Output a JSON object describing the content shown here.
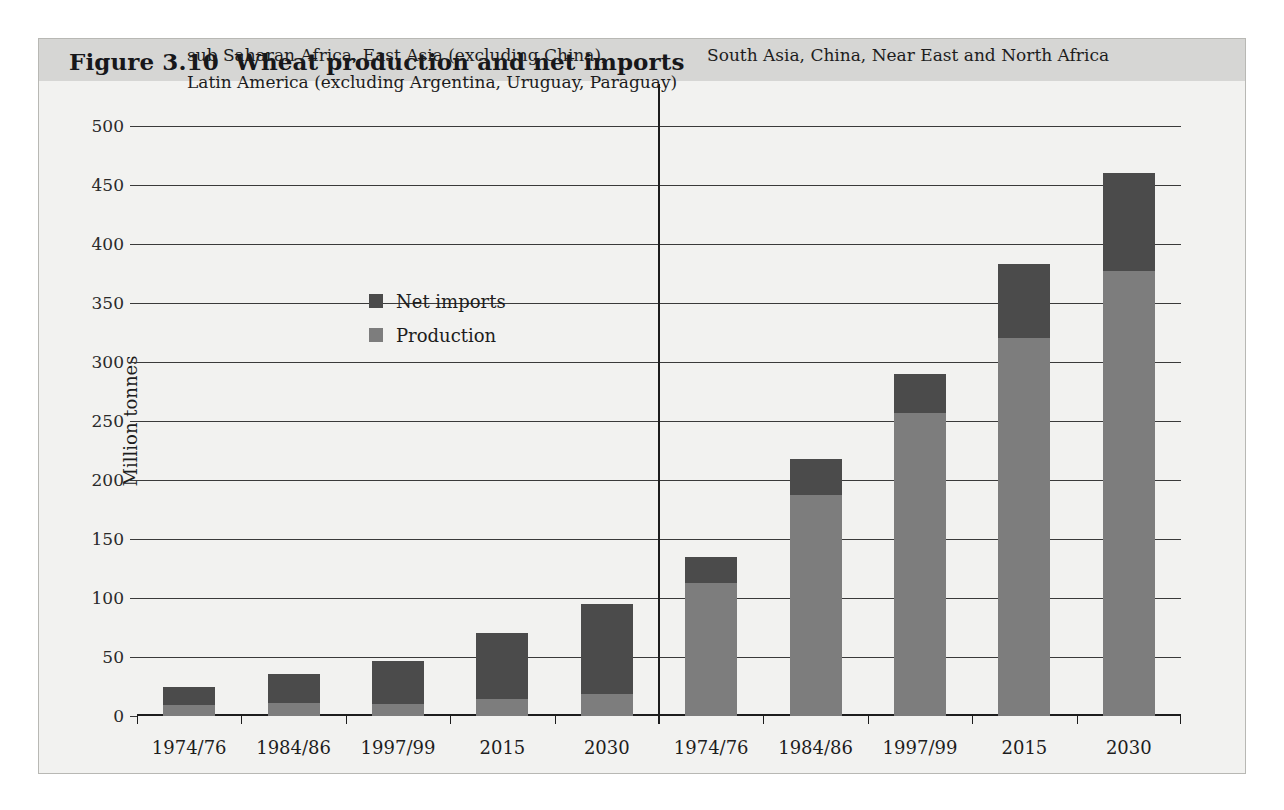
{
  "figure": {
    "title": "Figure 3.10  Wheat production and net imports",
    "y_axis_title": "Million tonnes"
  },
  "legend": {
    "items": [
      {
        "label": "Net imports",
        "color": "#4b4b4b",
        "key": "net_imports"
      },
      {
        "label": "Production",
        "color": "#7d7d7d",
        "key": "production"
      }
    ]
  },
  "panels": [
    {
      "caption_line1": "sub Saharan Africa, East Asia (excluding China),",
      "caption_line2": "Latin America (excluding Argentina, Uruguay, Paraguay)"
    },
    {
      "caption_line1": "South Asia, China, Near East and North Africa",
      "caption_line2": ""
    }
  ],
  "chart_data": {
    "type": "bar",
    "title": "Figure 3.10  Wheat production and net imports",
    "xlabel": "",
    "ylabel": "Million tonnes",
    "ylim": [
      0,
      500
    ],
    "ytick_labels": [
      "0",
      "50",
      "100",
      "150",
      "200",
      "250",
      "300",
      "350",
      "400",
      "450",
      "500"
    ],
    "yticks": [
      0,
      50,
      100,
      150,
      200,
      250,
      300,
      350,
      400,
      450,
      500
    ],
    "grid": true,
    "stacked": true,
    "legend_position": "inside-upper-left",
    "categories": [
      "1974/76",
      "1984/86",
      "1997/99",
      "2015",
      "2030"
    ],
    "panels": [
      {
        "name": "sub Saharan Africa, East Asia (excluding China), Latin America (excluding Argentina, Uruguay, Paraguay)",
        "categories": [
          "1974/76",
          "1984/86",
          "1997/99",
          "2015",
          "2030"
        ],
        "series": [
          {
            "name": "Production",
            "values": [
              9,
              11,
              10,
              14,
              19
            ]
          },
          {
            "name": "Net imports",
            "values": [
              16,
              25,
              37,
              56,
              76
            ]
          }
        ],
        "totals": [
          25,
          36,
          47,
          70,
          95
        ]
      },
      {
        "name": "South Asia, China, Near East and North Africa",
        "categories": [
          "1974/76",
          "1984/86",
          "1997/99",
          "2015",
          "2030"
        ],
        "series": [
          {
            "name": "Production",
            "values": [
              113,
              187,
              257,
              320,
              377
            ]
          },
          {
            "name": "Net imports",
            "values": [
              22,
              31,
              33,
              63,
              83
            ]
          }
        ],
        "totals": [
          135,
          218,
          290,
          383,
          460
        ]
      }
    ]
  }
}
